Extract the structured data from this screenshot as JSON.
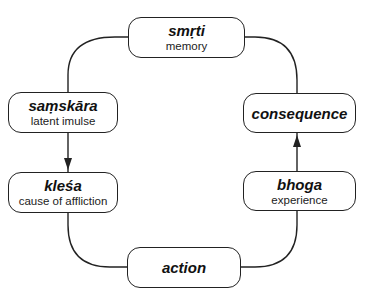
{
  "diagram": {
    "nodes": [
      {
        "id": "smrti",
        "term": "smṛti",
        "gloss": "memory"
      },
      {
        "id": "samskara",
        "term": "saṃskāra",
        "gloss": "latent imulse"
      },
      {
        "id": "klesa",
        "term": "kleśa",
        "gloss": "cause of affliction"
      },
      {
        "id": "action",
        "term": "action",
        "gloss": ""
      },
      {
        "id": "bhoga",
        "term": "bhoga",
        "gloss": "experience"
      },
      {
        "id": "consequence",
        "term": "consequence",
        "gloss": ""
      }
    ],
    "edges": [
      {
        "from": "smrti",
        "to": "samskara",
        "arrow": false
      },
      {
        "from": "samskara",
        "to": "klesa",
        "arrow": true
      },
      {
        "from": "klesa",
        "to": "action",
        "arrow": false
      },
      {
        "from": "action",
        "to": "bhoga",
        "arrow": false
      },
      {
        "from": "bhoga",
        "to": "consequence",
        "arrow": true
      },
      {
        "from": "consequence",
        "to": "smrti",
        "arrow": false
      }
    ]
  }
}
